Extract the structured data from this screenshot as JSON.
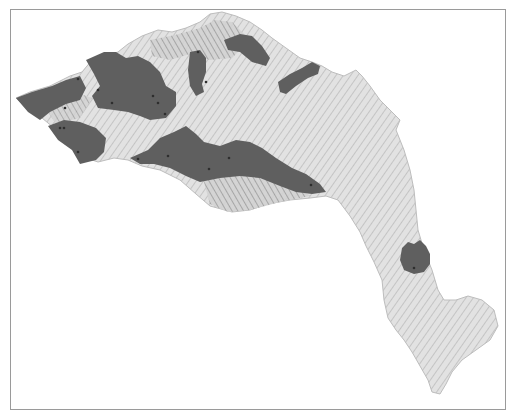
{
  "map": {
    "type": "hillshade-region-map",
    "frame": {
      "color": "#9a9a9a"
    },
    "colors": {
      "background": "#ffffff",
      "terrain_light": "#e6e6e6",
      "terrain_mid": "#cfcfcf",
      "terrain_shadow": "#9c9c9c",
      "highlight_region": "#5f5f5f",
      "point_marker": "#2e2e2e"
    },
    "landmass": "elongated region running from west (left) across the north, then descending south-east along a narrow peninsula",
    "highlighted_regions": [
      {
        "id": "west-coast-north"
      },
      {
        "id": "west-coast-south"
      },
      {
        "id": "northwest-central"
      },
      {
        "id": "north-enclave"
      },
      {
        "id": "north-ridge"
      },
      {
        "id": "northeast-strip"
      },
      {
        "id": "central-southern-band"
      },
      {
        "id": "southeast-plateau"
      }
    ],
    "labels": []
  }
}
